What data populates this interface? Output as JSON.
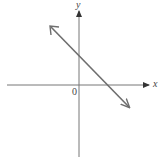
{
  "diagram": {
    "type": "coordinate-plane",
    "labels": {
      "x_axis": "x",
      "y_axis": "y",
      "origin": "0"
    },
    "line": {
      "description": "straight line with negative slope, arrows at both ends",
      "y_intercept": "positive",
      "x_intercept": "positive",
      "slope_sign": "negative"
    },
    "colors": {
      "axes": "#555555",
      "line": "#6e6e6e",
      "background": "#ffffff"
    }
  }
}
